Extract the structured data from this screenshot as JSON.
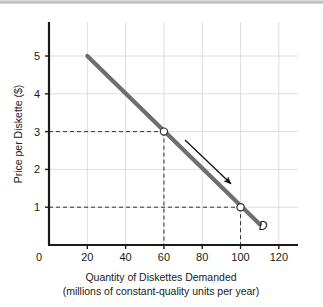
{
  "chart_data": {
    "type": "line",
    "title": "",
    "xlabel": "Quantity of Diskettes Demanded",
    "xlabel_sub": "(millions of constant-quality units per year)",
    "ylabel": "Price per Diskette ($)",
    "xlim": [
      0,
      130
    ],
    "ylim": [
      0,
      5.9
    ],
    "xticks": [
      0,
      20,
      40,
      60,
      80,
      100,
      120
    ],
    "xtick_labels": [
      "0",
      "20",
      "40",
      "60",
      "80",
      "100",
      "120"
    ],
    "yticks": [
      1,
      2,
      3,
      4,
      5
    ],
    "ytick_labels": [
      "1",
      "2",
      "3",
      "4",
      "5"
    ],
    "grid": true,
    "legend": "none",
    "series": [
      {
        "name": "D",
        "label": "D",
        "color": "#6e6e6e",
        "x": [
          20,
          110
        ],
        "y": [
          5,
          0.55
        ],
        "markers": [
          {
            "x": 60,
            "y": 3,
            "style": "open-circle"
          },
          {
            "x": 100,
            "y": 1,
            "style": "open-circle"
          }
        ],
        "guides": [
          {
            "x": 60,
            "y": 3,
            "style": "dashed"
          },
          {
            "x": 100,
            "y": 1,
            "style": "dashed"
          }
        ]
      }
    ],
    "annotations": [
      {
        "type": "arrow",
        "label": "movement-along-demand-curve",
        "from": {
          "x": 71,
          "y": 2.78
        },
        "to": {
          "x": 95,
          "y": 1.62
        }
      }
    ]
  },
  "colors": {
    "curve": "#6e6e6e",
    "axis": "#1a1a1a",
    "grid": "#d5d5d5",
    "guide": "#333333",
    "background": "#ffffff"
  }
}
